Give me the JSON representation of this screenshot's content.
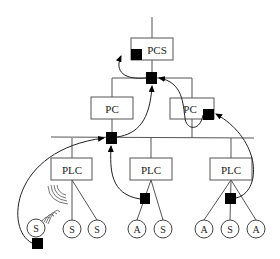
{
  "diagram": {
    "type": "hierarchical-control-network",
    "top": {
      "label": "PCS"
    },
    "pcs_level": [
      {
        "label": "PC"
      },
      {
        "label": "PC"
      }
    ],
    "plc_level": [
      {
        "label": "PLC",
        "children": [
          "S",
          "S",
          "S"
        ]
      },
      {
        "label": "PLC",
        "children": [
          "A",
          "S"
        ]
      },
      {
        "label": "PLC",
        "children": [
          "A",
          "S",
          "A"
        ]
      }
    ],
    "legend_symbols": {
      "S": "sensor",
      "A": "actuator",
      "black-square": "attack/compromise point",
      "wireless-waves": "wireless link"
    },
    "colors": {
      "line": "#555555",
      "marker": "#000000",
      "background": "#ffffff"
    }
  }
}
